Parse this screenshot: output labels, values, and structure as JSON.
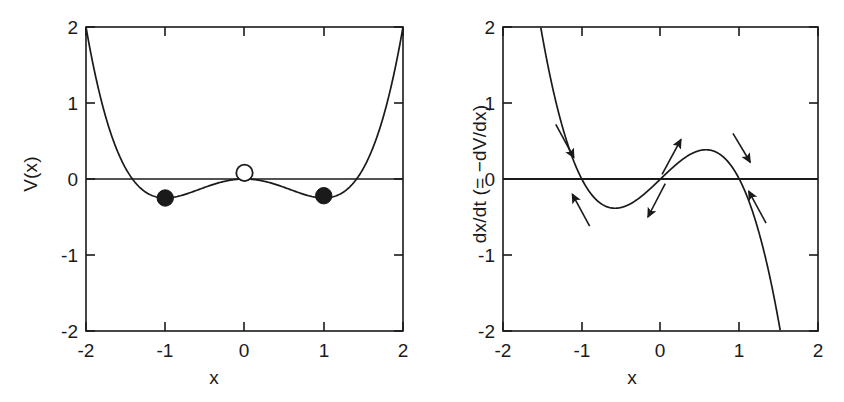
{
  "figure": {
    "background": "#ffffff",
    "ink_color": "#1a1a1a",
    "panels": [
      "potential",
      "flow"
    ]
  },
  "panel_left": {
    "name": "double-well-potential",
    "xlabel": "x",
    "ylabel": "V(x)",
    "xticklabels": [
      "-2",
      "-1",
      "0",
      "1",
      "2"
    ],
    "yticklabels": [
      "-2",
      "-1",
      "0",
      "1",
      "2"
    ],
    "markers": [
      {
        "kind": "filled",
        "label": "stable-equilibrium-left",
        "x": -1,
        "y": -0.25
      },
      {
        "kind": "open",
        "label": "unstable-equilibrium-center",
        "x": 0,
        "y": 0.08
      },
      {
        "kind": "filled",
        "label": "stable-equilibrium-right",
        "x": 1,
        "y": -0.22
      }
    ]
  },
  "panel_right": {
    "name": "flow-derivative",
    "xlabel": "x",
    "ylabel": "dx/dt (= −dV/dx)",
    "xticklabels": [
      "-2",
      "-1",
      "0",
      "1",
      "2"
    ],
    "yticklabels": [
      "-2",
      "-1",
      "0",
      "1",
      "2"
    ],
    "arrows": [
      {
        "label": "arrow-left-above-axis",
        "x1": -1.33,
        "y1": 0.72,
        "x2": -1.1,
        "y2": 0.28,
        "dir": "down-right"
      },
      {
        "label": "arrow-left-below-axis",
        "x1": -0.9,
        "y1": -0.62,
        "x2": -1.12,
        "y2": -0.2,
        "dir": "up-left"
      },
      {
        "label": "arrow-center-above-axis",
        "x1": 0.02,
        "y1": 0.06,
        "x2": 0.26,
        "y2": 0.52,
        "dir": "up-right"
      },
      {
        "label": "arrow-center-below-axis",
        "x1": 0.06,
        "y1": -0.06,
        "x2": -0.16,
        "y2": -0.5,
        "dir": "down-left"
      },
      {
        "label": "arrow-right-above-axis",
        "x1": 0.92,
        "y1": 0.6,
        "x2": 1.14,
        "y2": 0.22,
        "dir": "down-right"
      },
      {
        "label": "arrow-right-below-axis",
        "x1": 1.34,
        "y1": -0.58,
        "x2": 1.12,
        "y2": -0.16,
        "dir": "up-left"
      }
    ]
  },
  "chart_data": [
    {
      "type": "line",
      "name": "potential",
      "title": "",
      "xlabel": "x",
      "ylabel": "V(x)",
      "xlim": [
        -2,
        2
      ],
      "ylim": [
        -2,
        2
      ],
      "xticks": [
        -2,
        -1,
        0,
        1,
        2
      ],
      "yticks": [
        -2,
        -1,
        0,
        1,
        2
      ],
      "grid": false,
      "legend": "none",
      "equation": "V(x) = (x^4 - 2x^2)/4",
      "series": [
        {
          "name": "V(x)",
          "x": [
            -2.0,
            -1.9,
            -1.8,
            -1.7,
            -1.6,
            -1.5,
            -1.4,
            -1.3,
            -1.2,
            -1.1,
            -1.0,
            -0.9,
            -0.8,
            -0.7,
            -0.6,
            -0.5,
            -0.4,
            -0.3,
            -0.2,
            -0.1,
            0.0,
            0.1,
            0.2,
            0.3,
            0.4,
            0.5,
            0.6,
            0.7,
            0.8,
            0.9,
            1.0,
            1.1,
            1.2,
            1.3,
            1.4,
            1.5,
            1.6,
            1.7,
            1.8,
            1.9,
            2.0
          ],
          "values": [
            2.0,
            1.255,
            0.66,
            0.199,
            -0.146,
            -0.391,
            -0.549,
            -0.631,
            -0.648,
            -0.61,
            -0.25,
            -0.245,
            -0.218,
            -0.18,
            -0.136,
            -0.094,
            -0.058,
            -0.031,
            -0.012,
            -0.003,
            0.0,
            -0.003,
            -0.012,
            -0.031,
            -0.058,
            -0.094,
            -0.136,
            -0.18,
            -0.218,
            -0.245,
            -0.25,
            -0.229,
            -0.202,
            -0.11,
            0.059,
            0.316,
            0.678,
            1.164,
            1.793,
            2.0,
            2.0
          ]
        }
      ],
      "points": [
        {
          "x": -1,
          "y": -0.25,
          "marker": "filled-circle",
          "meaning": "stable equilibrium"
        },
        {
          "x": 0,
          "y": 0.08,
          "marker": "open-circle",
          "meaning": "unstable equilibrium"
        },
        {
          "x": 1,
          "y": -0.22,
          "marker": "filled-circle",
          "meaning": "stable equilibrium"
        }
      ]
    },
    {
      "type": "line",
      "name": "flow",
      "title": "",
      "xlabel": "x",
      "ylabel": "dx/dt (= −dV/dx)",
      "xlim": [
        -2,
        2
      ],
      "ylim": [
        -2,
        2
      ],
      "xticks": [
        -2,
        -1,
        0,
        1,
        2
      ],
      "yticks": [
        -2,
        -1,
        0,
        1,
        2
      ],
      "grid": false,
      "legend": "none",
      "equation": "dx/dt = x - x^3",
      "series": [
        {
          "name": "dx/dt",
          "x": [
            -1.45,
            -1.4,
            -1.3,
            -1.2,
            -1.1,
            -1.0,
            -0.9,
            -0.8,
            -0.7,
            -0.6,
            -0.5,
            -0.4,
            -0.3,
            -0.2,
            -0.1,
            0.0,
            0.1,
            0.2,
            0.3,
            0.4,
            0.5,
            0.6,
            0.7,
            0.8,
            0.9,
            1.0,
            1.1,
            1.2,
            1.3,
            1.4,
            1.5
          ],
          "values": [
            1.599,
            1.344,
            0.897,
            0.528,
            0.231,
            0.0,
            -0.171,
            -0.288,
            -0.357,
            -0.384,
            -0.375,
            -0.336,
            -0.273,
            -0.192,
            -0.099,
            0.0,
            0.099,
            0.192,
            0.273,
            0.336,
            0.375,
            0.384,
            0.357,
            0.288,
            0.171,
            0.0,
            -0.231,
            -0.528,
            -0.897,
            -1.344,
            -1.875
          ]
        }
      ],
      "zero_crossings": [
        -1,
        0,
        1
      ]
    }
  ]
}
